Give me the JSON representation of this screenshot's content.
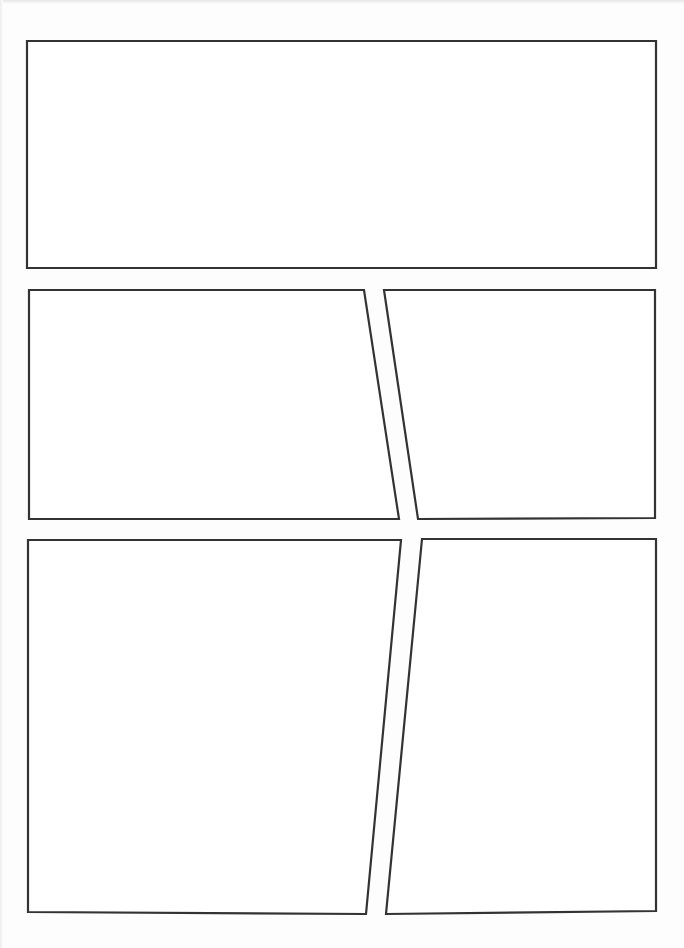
{
  "page": {
    "type": "comic-page-template",
    "width": 684,
    "height": 948,
    "background": "#fdfdfd",
    "panel_fill": "#ffffff",
    "border_color": "#333333",
    "panels": [
      {
        "id": "panel-1",
        "row": 1,
        "points": "27,41 656,41 656,268 27,268"
      },
      {
        "id": "panel-2",
        "row": 2,
        "points": "29,290 364,290 399,519 29,519"
      },
      {
        "id": "panel-3",
        "row": 2,
        "points": "384,290 655,290 655,518 418,519"
      },
      {
        "id": "panel-4",
        "row": 3,
        "points": "28,540 401,540 366,914 28,912"
      },
      {
        "id": "panel-5",
        "row": 3,
        "points": "422,539 656,539 656,911 386,914"
      }
    ]
  }
}
